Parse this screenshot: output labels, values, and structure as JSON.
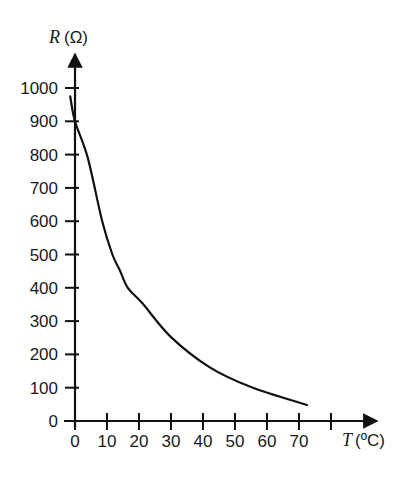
{
  "chart_data": {
    "type": "line",
    "title": "",
    "xlabel": "T (°C)",
    "ylabel": "R (Ω)",
    "xlabel_var": "T",
    "xlabel_unit": "(ºC)",
    "ylabel_var": "R",
    "ylabel_unit": "(Ω)",
    "xlim": [
      0,
      80
    ],
    "ylim": [
      0,
      1000
    ],
    "grid": false,
    "legend": null,
    "x_ticks": [
      0,
      10,
      20,
      30,
      40,
      50,
      60,
      70,
      80
    ],
    "x_tick_labels": [
      "0",
      "10",
      "20",
      "30",
      "40",
      "50",
      "60",
      "70",
      ""
    ],
    "y_ticks": [
      0,
      100,
      200,
      300,
      400,
      500,
      600,
      700,
      800,
      900,
      1000
    ],
    "y_tick_labels": [
      "0",
      "100",
      "200",
      "300",
      "400",
      "500",
      "600",
      "700",
      "800",
      "900",
      "1000"
    ],
    "series": [
      {
        "name": "Resistance vs Temperature",
        "x": [
          -1.5,
          0,
          4,
          8.5,
          11.7,
          14,
          16.5,
          21,
          30,
          42,
          55,
          72.5
        ],
        "y": [
          975,
          900,
          790,
          600,
          500,
          453,
          400,
          354,
          252,
          162,
          102,
          48
        ]
      }
    ],
    "colors": {
      "line": "#111111",
      "axis": "#111111",
      "text": "#1a1a1a"
    }
  }
}
